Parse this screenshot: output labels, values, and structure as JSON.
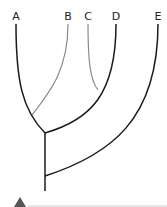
{
  "diagram": {
    "type": "phylogenetic-tree",
    "taxa": [
      "A",
      "B",
      "C",
      "D",
      "E"
    ],
    "structure": "(((A,B),(C,D)),E)",
    "colors": {
      "main_branch": "#1a1a1a",
      "light_branch": "#8a8a8a",
      "label": "#222222",
      "triangle": "#555555",
      "baseline": "#e6e6e6"
    }
  }
}
